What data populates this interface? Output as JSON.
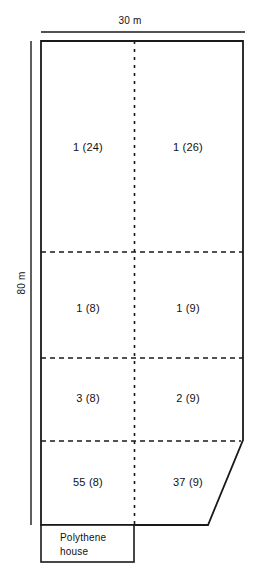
{
  "figure": {
    "type": "field-plot-diagram",
    "scales": {
      "top": {
        "label": "30 m",
        "icon": "horizontal-scale-bar"
      },
      "left": {
        "label": "80 m",
        "icon": "vertical-scale-bar"
      }
    },
    "structure": {
      "outline_shape": "rectangle-with-cut-bottom-right-corner",
      "column_divider": "dashed-vertical",
      "row_dividers": "dashed-horizontal",
      "columns": 2,
      "rows": 4
    },
    "plots": [
      {
        "row": 1,
        "col": 1,
        "label": "1 (24)"
      },
      {
        "row": 1,
        "col": 2,
        "label": "1 (26)"
      },
      {
        "row": 2,
        "col": 1,
        "label": "1 (8)"
      },
      {
        "row": 2,
        "col": 2,
        "label": "1 (9)"
      },
      {
        "row": 3,
        "col": 1,
        "label": "3 (8)"
      },
      {
        "row": 3,
        "col": 2,
        "label": "2 (9)"
      },
      {
        "row": 4,
        "col": 1,
        "label": "55 (8)"
      },
      {
        "row": 4,
        "col": 2,
        "label": "37 (9)"
      }
    ],
    "annex": {
      "label": "Polythene\nhouse"
    },
    "colors": {
      "line": "#1a1a1a",
      "background": "#ffffff",
      "text": "#111111"
    }
  }
}
